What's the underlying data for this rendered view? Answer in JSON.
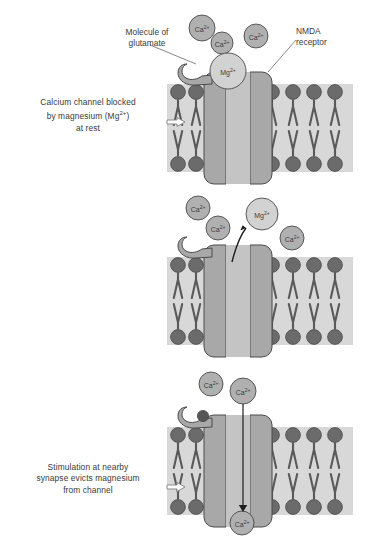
{
  "figure": {
    "background": "#ffffff",
    "colors": {
      "head_dark": "#6b6b6b",
      "tail_dark": "#5a5a5a",
      "membrane_fill": "#d8d8d8",
      "receptor_fill": "#a8a8a8",
      "channel_fill": "#c4c4c4",
      "ion_ca_fill": "#b0b0b0",
      "ion_mg_fill": "#d2d2d2",
      "glutamate_fill": "#555555",
      "stroke": "#4a4a4a",
      "text": "#3a3a3a"
    }
  },
  "panels": [
    {
      "id": "panel-rest",
      "caption": "Calcium channel blocked\nby magnesium (Mg2+)\nat rest",
      "caption_line1": "Calcium channel blocked",
      "caption_line2_pre": "by magnesium (Mg",
      "caption_line2_sup": "2+",
      "caption_line2_post": ")",
      "caption_line3": "at rest",
      "labels": [
        {
          "name": "molecule-of-glutamate",
          "text": "Molecule of\nglutamate"
        },
        {
          "name": "nmda-receptor",
          "text": "NMDA\nreceptor"
        }
      ],
      "ions": [
        {
          "species": "Ca",
          "charge": "2+",
          "x": 202,
          "y": 28,
          "r": 13
        },
        {
          "species": "Ca",
          "charge": "2+",
          "x": 222,
          "y": 43,
          "r": 11
        },
        {
          "species": "Ca",
          "charge": "2+",
          "x": 256,
          "y": 36,
          "r": 12
        },
        {
          "species": "Mg",
          "charge": "2+",
          "x": 228,
          "y": 71,
          "r": 18
        }
      ],
      "glutamate_bound": false,
      "glutamate_present": true,
      "channel_open": false,
      "arrows": []
    },
    {
      "id": "panel-stimulation",
      "caption": "Stimulation at nearby\nsynapse evicts magnesium\nfrom channel",
      "caption_line1": "Stimulation at nearby",
      "caption_line2": "synapse evicts magnesium",
      "caption_line3": "from channel",
      "labels": [],
      "ions": [
        {
          "species": "Ca",
          "charge": "2+",
          "x": 198,
          "y": 208,
          "r": 12
        },
        {
          "species": "Ca",
          "charge": "2+",
          "x": 218,
          "y": 228,
          "r": 12
        },
        {
          "species": "Mg",
          "charge": "2+",
          "x": 262,
          "y": 214,
          "r": 16
        },
        {
          "species": "Ca",
          "charge": "2+",
          "x": 292,
          "y": 238,
          "r": 12
        }
      ],
      "glutamate_bound": false,
      "glutamate_present": false,
      "channel_open": false,
      "arrows": [
        {
          "name": "magnesium-eviction-arrow",
          "type": "curved-up"
        }
      ]
    },
    {
      "id": "panel-open",
      "caption": "Glutamate molecule now\nbinds with NMDA receptor\nand opens ion channel",
      "caption_line1": "Glutamate molecule now",
      "caption_line2": "binds with NMDA receptor",
      "caption_line3": "and opens ion channel",
      "labels": [],
      "ions": [
        {
          "species": "Ca",
          "charge": "2+",
          "x": 211,
          "y": 384,
          "r": 12
        },
        {
          "species": "Ca",
          "charge": "2+",
          "x": 243,
          "y": 391,
          "r": 13
        },
        {
          "species": "Ca",
          "charge": "2+",
          "x": 242,
          "y": 523,
          "r": 12
        }
      ],
      "glutamate_bound": true,
      "glutamate_present": true,
      "channel_open": true,
      "arrows": [
        {
          "name": "calcium-influx-arrow",
          "type": "straight-down"
        }
      ]
    }
  ],
  "membrane": {
    "left_lipid_count": 3,
    "right_lipid_count": 4,
    "leaflets": 2
  },
  "ion_species": {
    "Ca": "Ca",
    "Mg": "Mg",
    "charge": "2+"
  }
}
